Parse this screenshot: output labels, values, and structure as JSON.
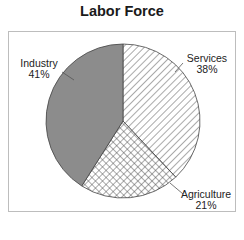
{
  "chart_data": {
    "type": "pie",
    "title": "Labor Force",
    "slices": [
      {
        "label": "Services",
        "value": 38,
        "pct_label": "38%",
        "fill": "diagonal-hatch"
      },
      {
        "label": "Agriculture",
        "value": 21,
        "pct_label": "21%",
        "fill": "crosshatch"
      },
      {
        "label": "Industry",
        "value": 41,
        "pct_label": "41%",
        "fill": "#8c8c8c"
      }
    ],
    "start_angle_deg": 0,
    "direction": "clockwise",
    "legend": "none",
    "labels": "outside with leader lines"
  },
  "colors": {
    "industry": "#8c8c8c",
    "hatch_line": "#555555",
    "frame": "#bdbdbd"
  }
}
